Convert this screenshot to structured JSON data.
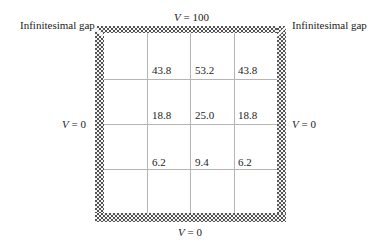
{
  "diagram": {
    "boundaries": {
      "top": {
        "symbol": "V",
        "value": "= 100"
      },
      "left": {
        "symbol": "V",
        "value": "= 0"
      },
      "right": {
        "symbol": "V",
        "value": "= 0"
      },
      "bottom": {
        "symbol": "V",
        "value": "= 0"
      }
    },
    "gap_labels": {
      "left": "Infinitesimal gap",
      "right": "Infinitesimal gap"
    },
    "grid": {
      "rows": 4,
      "cols": 4,
      "values": [
        [
          "",
          "43.8",
          "53.2",
          "43.8"
        ],
        [
          "",
          "18.8",
          "25.0",
          "18.8"
        ],
        [
          "",
          "6.2",
          "9.4",
          "6.2"
        ],
        [
          "",
          "",
          "",
          ""
        ]
      ]
    }
  }
}
